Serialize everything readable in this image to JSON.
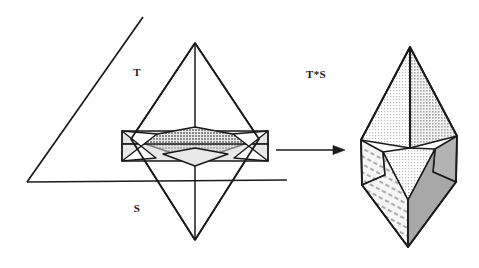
{
  "figure": {
    "background_color": "#ffffff",
    "stroke_color": "#1a1a1a",
    "labels": [
      {
        "id": "label-t",
        "text": "T",
        "x": 137,
        "y": 76
      },
      {
        "id": "label-s",
        "text": "S",
        "x": 137,
        "y": 212
      },
      {
        "id": "label-t-s",
        "text": "T*S",
        "x": 306,
        "y": 78
      }
    ],
    "arrow": {
      "name": "transform-arrow",
      "x1": 276,
      "y1": 150,
      "x2": 340,
      "y2": 150,
      "head_width": 13,
      "head_height": 9
    },
    "fills": {
      "white": "#ffffff",
      "light_gray": "#ececec",
      "pale_gray": "#e2e2e2",
      "mid_gray": "#b9b9b9",
      "dark_gray": "#9a9a9a",
      "hatch_gray": "#f2f2f2",
      "band_gray": "#d2d2d2"
    },
    "left_scene": {
      "name": "left-scene-t-and-s",
      "plane_s": {
        "name": "plane-s-outline",
        "triangle": [
          [
            27,
            182
          ],
          [
            143,
            17
          ],
          [
            143,
            182
          ]
        ],
        "baseline": [
          [
            27,
            182
          ],
          [
            287,
            180
          ]
        ]
      },
      "bipyramid": {
        "name": "bipyramid-t",
        "top_apex": [
          195,
          43
        ],
        "bottom_apex": [
          195,
          240
        ],
        "left_vertex": [
          131,
          139
        ],
        "right_vertex": [
          259,
          139
        ],
        "front_vertex": [
          195,
          166
        ],
        "back_vertex": [
          195,
          127
        ]
      },
      "slab": {
        "name": "slab-s-band",
        "top_front": [
          [
            122,
            144
          ],
          [
            268,
            144
          ]
        ],
        "bottom_front": [
          [
            122,
            161
          ],
          [
            268,
            161
          ]
        ],
        "top_back": [
          [
            122,
            131
          ],
          [
            268,
            131
          ]
        ],
        "left_cap": [
          [
            122,
            131
          ],
          [
            122,
            161
          ]
        ],
        "right_cap": [
          [
            268,
            131
          ],
          [
            268,
            161
          ]
        ]
      }
    },
    "right_scene": {
      "name": "right-scene-t-star-s",
      "solid": {
        "name": "minkowski-solid",
        "top_apex": [
          410,
          47
        ],
        "bottom_apex": [
          408,
          247
        ],
        "upper_left": [
          361,
          140
        ],
        "upper_right": [
          457,
          136
        ],
        "lower_left": [
          362,
          185
        ],
        "lower_right": [
          456,
          182
        ],
        "mid_upper": [
          410,
          148
        ],
        "mid_lower": [
          408,
          200
        ]
      },
      "faces": [
        {
          "name": "face-top-left",
          "shade": "pale_gray"
        },
        {
          "name": "face-top-right",
          "shade": "light_gray"
        },
        {
          "name": "face-middle-center",
          "shade": "light_gray"
        },
        {
          "name": "face-middle-left",
          "shade": "hatch_gray",
          "pattern": "hatch"
        },
        {
          "name": "face-middle-right",
          "shade": "mid_gray"
        },
        {
          "name": "face-bottom-left",
          "shade": "hatch_gray",
          "pattern": "hatch"
        },
        {
          "name": "face-bottom-right",
          "shade": "dark_gray"
        }
      ]
    }
  }
}
